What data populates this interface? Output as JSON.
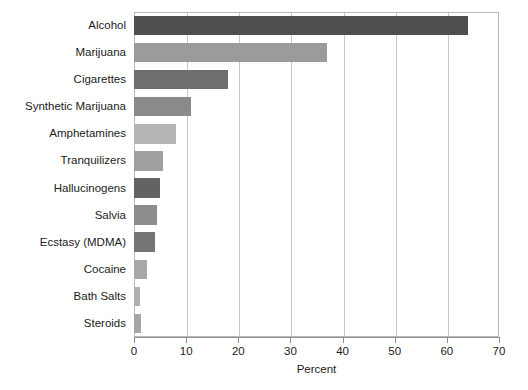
{
  "chart_data": {
    "type": "bar",
    "orientation": "horizontal",
    "title": "",
    "xlabel": "Percent",
    "ylabel": "",
    "xlim": [
      0,
      70
    ],
    "xticks": [
      0,
      10,
      20,
      30,
      40,
      50,
      60,
      70
    ],
    "grid": "vertical",
    "legend": "none",
    "categories": [
      "Alcohol",
      "Marijuana",
      "Cigarettes",
      "Synthetic Marijuana",
      "Amphetamines",
      "Tranquilizers",
      "Hallucinogens",
      "Salvia",
      "Ecstasy (MDMA)",
      "Cocaine",
      "Bath Salts",
      "Steroids"
    ],
    "values": [
      64,
      37,
      18,
      11,
      8,
      5.5,
      5,
      4.5,
      4,
      2.5,
      1.2,
      1.3
    ],
    "bar_colors": [
      "#4f4f4f",
      "#9b9b9b",
      "#6e6e6e",
      "#8a8a8a",
      "#b5b5b5",
      "#a0a0a0",
      "#636363",
      "#8d8d8d",
      "#757575",
      "#a8a8a8",
      "#b0b0b0",
      "#a6a6a6"
    ]
  },
  "axis": {
    "tick_labels": [
      "0",
      "10",
      "20",
      "30",
      "40",
      "50",
      "60",
      "70"
    ],
    "title": "Percent"
  },
  "colors": {
    "frame": "#b9b9b9",
    "gridline": "#c7c7c7",
    "axis": "#8f8f8f",
    "text": "#1c1c1c",
    "background": "#ffffff"
  }
}
